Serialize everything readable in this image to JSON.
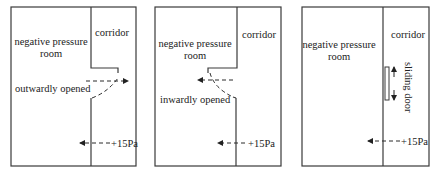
{
  "panels": [
    {
      "room_label_line1": "negative pressure",
      "room_label_line2": "room",
      "corridor_label": "corridor",
      "door_label": "outwardly opened",
      "pressure_label": "+15Pa"
    },
    {
      "room_label_line1": "negative pressure",
      "room_label_line2": "room",
      "corridor_label": "corridor",
      "door_label": "inwardly opened",
      "pressure_label": "+15Pa"
    },
    {
      "room_label_line1": "negative pressure",
      "room_label_line2": "room",
      "corridor_label": "corridor",
      "door_label": "sliding door",
      "pressure_label": "+15Pa"
    }
  ],
  "colors": {
    "line": "#3a3a3a",
    "text": "#222222",
    "background": "#ffffff"
  }
}
